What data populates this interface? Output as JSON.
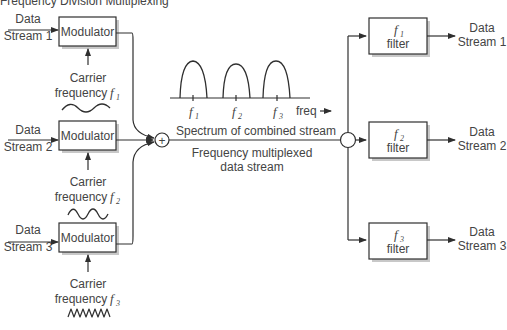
{
  "title": "Frequency Division Multiplexing",
  "modulators": [
    {
      "label": "Modulator",
      "input_line1": "Data",
      "input_line2": "Stream 1",
      "carrier_line1": "Carrier",
      "carrier_line2": "frequency",
      "carrier_symbol": "f",
      "carrier_sub": "1"
    },
    {
      "label": "Modulator",
      "input_line1": "Data",
      "input_line2": "Stream 2",
      "carrier_line1": "Carrier",
      "carrier_line2": "frequency",
      "carrier_symbol": "f",
      "carrier_sub": "2"
    },
    {
      "label": "Modulator",
      "input_line1": "Data",
      "input_line2": "Stream 3",
      "carrier_line1": "Carrier",
      "carrier_line2": "frequency",
      "carrier_symbol": "f",
      "carrier_sub": "3"
    }
  ],
  "summer": {
    "symbol": "+"
  },
  "spectrum": {
    "caption": "Spectrum of combined stream",
    "axis_label": "freq",
    "ticks": [
      {
        "symbol": "f",
        "sub": "1"
      },
      {
        "symbol": "f",
        "sub": "2"
      },
      {
        "symbol": "f",
        "sub": "3"
      }
    ]
  },
  "combined": {
    "line1": "Frequency multiplexed",
    "line2": "data stream"
  },
  "filters": [
    {
      "symbol": "f",
      "sub": "1",
      "label": "filter",
      "output_line1": "Data",
      "output_line2": "Stream 1"
    },
    {
      "symbol": "f",
      "sub": "2",
      "label": "filter",
      "output_line1": "Data",
      "output_line2": "Stream 2"
    },
    {
      "symbol": "f",
      "sub": "3",
      "label": "filter",
      "output_line1": "Data",
      "output_line2": "Stream 3"
    }
  ],
  "colors": {
    "stroke": "#2f2f2f",
    "text": "#444444",
    "shadow": "#c8c8c8"
  }
}
